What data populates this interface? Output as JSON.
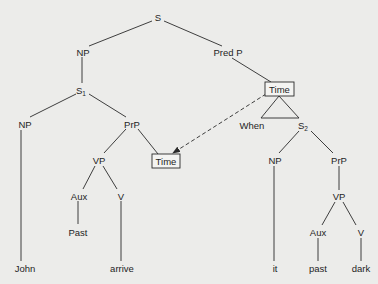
{
  "diagram": {
    "type": "syntax-tree",
    "colors": {
      "background": "#ececea",
      "ink": "#1e1e1e"
    },
    "nodes": {
      "root": {
        "label": "S"
      },
      "np_top": {
        "label": "NP"
      },
      "predp": {
        "label": "Pred P"
      },
      "s1": {
        "label": "S",
        "subscript": "1"
      },
      "time_upper": {
        "label": "Time"
      },
      "np_left": {
        "label": "NP"
      },
      "prp_left": {
        "label": "PrP"
      },
      "when": {
        "label": "When"
      },
      "s2": {
        "label": "S",
        "subscript": "2"
      },
      "vp_left": {
        "label": "VP"
      },
      "time_lower": {
        "label": "Time"
      },
      "np_right": {
        "label": "NP"
      },
      "prp_right": {
        "label": "PrP"
      },
      "aux_left": {
        "label": "Aux"
      },
      "v_left": {
        "label": "V"
      },
      "vp_right": {
        "label": "VP"
      },
      "past_left": {
        "label": "Past"
      },
      "aux_right": {
        "label": "Aux"
      },
      "v_right": {
        "label": "V"
      },
      "john": {
        "label": "John"
      },
      "arrive": {
        "label": "arrive"
      },
      "it": {
        "label": "it"
      },
      "past_right": {
        "label": "past"
      },
      "dark": {
        "label": "dark"
      }
    },
    "edges": [
      [
        "root",
        "np_top"
      ],
      [
        "root",
        "predp"
      ],
      [
        "np_top",
        "s1"
      ],
      [
        "predp",
        "time_upper"
      ],
      [
        "s1",
        "np_left"
      ],
      [
        "s1",
        "prp_left"
      ],
      [
        "time_upper",
        "when"
      ],
      [
        "time_upper",
        "s2"
      ],
      [
        "np_left",
        "john"
      ],
      [
        "prp_left",
        "vp_left"
      ],
      [
        "prp_left",
        "time_lower"
      ],
      [
        "vp_left",
        "aux_left"
      ],
      [
        "vp_left",
        "v_left"
      ],
      [
        "aux_left",
        "past_left"
      ],
      [
        "v_left",
        "arrive"
      ],
      [
        "s2",
        "np_right"
      ],
      [
        "s2",
        "prp_right"
      ],
      [
        "np_right",
        "it"
      ],
      [
        "prp_right",
        "vp_right"
      ],
      [
        "vp_right",
        "aux_right"
      ],
      [
        "vp_right",
        "v_right"
      ],
      [
        "aux_right",
        "past_right"
      ],
      [
        "v_right",
        "dark"
      ]
    ],
    "movement_arrow": {
      "from": "time_upper",
      "to": "time_lower",
      "style": "dashed"
    },
    "triangle_under": "time_upper"
  }
}
